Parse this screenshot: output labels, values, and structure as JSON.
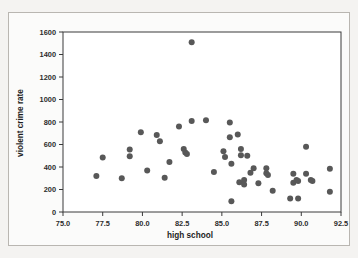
{
  "figure": {
    "background_color": "#f4f3f1",
    "panel_color": "#ffffff",
    "frame_color": "#b9b6b1",
    "point_color": "#585858",
    "axis_color": "#3a3a3a"
  },
  "chart_data": {
    "type": "scatter",
    "title": "",
    "xlabel": "high school",
    "ylabel": "violent crime rate",
    "xlim": [
      75.0,
      92.5
    ],
    "ylim": [
      0,
      1600
    ],
    "xticks": [
      75.0,
      77.5,
      80.0,
      82.5,
      85.0,
      87.5,
      90.0,
      92.5
    ],
    "xtick_labels": [
      "75.0",
      "77.5",
      "80.0",
      "82.5",
      "85.0",
      "87.5",
      "90.0",
      "92.5"
    ],
    "yticks": [
      0,
      200,
      400,
      600,
      800,
      1000,
      1200,
      1400,
      1600
    ],
    "ytick_labels": [
      "0",
      "200",
      "400",
      "600",
      "800",
      "1000",
      "1200",
      "1400",
      "1600"
    ],
    "grid": false,
    "legend": "none",
    "marker": "circle",
    "marker_size": 3,
    "points": [
      {
        "x": 77.1,
        "y": 320
      },
      {
        "x": 77.5,
        "y": 485
      },
      {
        "x": 78.7,
        "y": 300
      },
      {
        "x": 79.2,
        "y": 555
      },
      {
        "x": 79.2,
        "y": 495
      },
      {
        "x": 79.9,
        "y": 710
      },
      {
        "x": 80.3,
        "y": 370
      },
      {
        "x": 80.9,
        "y": 685
      },
      {
        "x": 81.1,
        "y": 630
      },
      {
        "x": 81.4,
        "y": 305
      },
      {
        "x": 81.7,
        "y": 445
      },
      {
        "x": 82.3,
        "y": 760
      },
      {
        "x": 82.6,
        "y": 560
      },
      {
        "x": 82.7,
        "y": 530
      },
      {
        "x": 82.8,
        "y": 515
      },
      {
        "x": 83.1,
        "y": 1510
      },
      {
        "x": 83.1,
        "y": 810
      },
      {
        "x": 84.0,
        "y": 815
      },
      {
        "x": 84.5,
        "y": 355
      },
      {
        "x": 85.1,
        "y": 540
      },
      {
        "x": 85.2,
        "y": 490
      },
      {
        "x": 85.5,
        "y": 795
      },
      {
        "x": 85.5,
        "y": 665
      },
      {
        "x": 85.6,
        "y": 430
      },
      {
        "x": 85.6,
        "y": 95
      },
      {
        "x": 86.0,
        "y": 690
      },
      {
        "x": 86.2,
        "y": 560
      },
      {
        "x": 86.2,
        "y": 505
      },
      {
        "x": 86.1,
        "y": 265
      },
      {
        "x": 86.4,
        "y": 285
      },
      {
        "x": 86.4,
        "y": 245
      },
      {
        "x": 86.6,
        "y": 500
      },
      {
        "x": 86.8,
        "y": 350
      },
      {
        "x": 87.0,
        "y": 390
      },
      {
        "x": 87.3,
        "y": 255
      },
      {
        "x": 87.8,
        "y": 390
      },
      {
        "x": 87.8,
        "y": 345
      },
      {
        "x": 87.9,
        "y": 330
      },
      {
        "x": 88.2,
        "y": 190
      },
      {
        "x": 89.3,
        "y": 120
      },
      {
        "x": 89.5,
        "y": 340
      },
      {
        "x": 89.5,
        "y": 260
      },
      {
        "x": 89.7,
        "y": 285
      },
      {
        "x": 89.8,
        "y": 275
      },
      {
        "x": 89.8,
        "y": 120
      },
      {
        "x": 90.3,
        "y": 580
      },
      {
        "x": 90.3,
        "y": 340
      },
      {
        "x": 90.6,
        "y": 285
      },
      {
        "x": 90.7,
        "y": 275
      },
      {
        "x": 91.8,
        "y": 385
      },
      {
        "x": 91.8,
        "y": 180
      }
    ]
  }
}
